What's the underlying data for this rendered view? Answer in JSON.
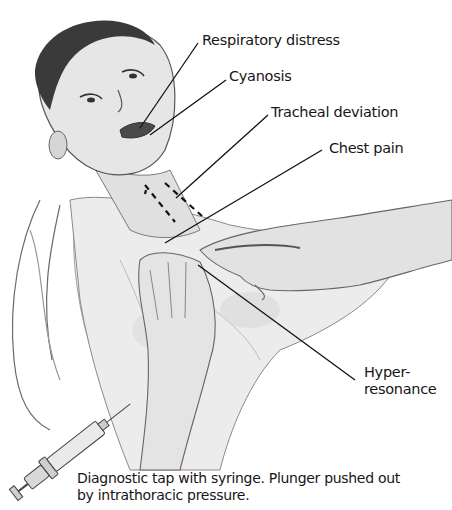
{
  "figure": {
    "labels": [
      {
        "id": "respiratory-distress",
        "text": "Respiratory distress",
        "x": 202,
        "y": 31
      },
      {
        "id": "cyanosis",
        "text": "Cyanosis",
        "x": 229,
        "y": 67
      },
      {
        "id": "tracheal-deviation",
        "text": "Tracheal deviation",
        "x": 271,
        "y": 103
      },
      {
        "id": "chest-pain",
        "text": "Chest pain",
        "x": 329,
        "y": 139
      }
    ],
    "hyper_resonance": {
      "line1": "Hyper-",
      "line2": "resonance",
      "x": 364,
      "y": 360
    },
    "caption": {
      "line1": "Diagnostic tap with syringe. Plunger pushed out",
      "line2": "by intrathoracic pressure."
    },
    "colors": {
      "ink": "#161616",
      "background": "#ffffff",
      "shading": "#9a9a9a"
    }
  }
}
